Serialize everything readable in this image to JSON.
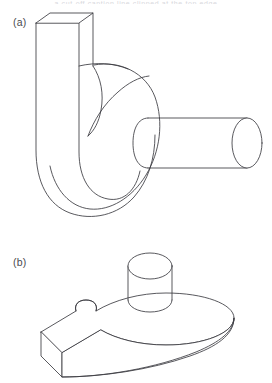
{
  "figure": {
    "background_color": "#ffffff",
    "line_color": "#3b3b41",
    "label_color": "#4a4a50",
    "caption_remnant": "a cut-off caption line clipped at the top edge",
    "panels": [
      {
        "id": "a",
        "label": "(a)",
        "description": "Isometric line drawing of a J-shaped hook bracket standing upright: a tall rectangular prism arm on the left curving into a rounded hook at the bottom, with a horizontal cylindrical boss projecting to the right from a disc-shaped head.",
        "features": [
          "rectangular-prism-arm",
          "curved-hook-base",
          "circular-disc-head",
          "horizontal-cylinder-boss",
          "concave-fillet-notch"
        ]
      },
      {
        "id": "b",
        "label": "(b)",
        "description": "Isometric line drawing of the same part lying flat: a teardrop shaped slab plate with a rectangular tab at the lower-left, a concave notch on its left side, and a short vertical cylindrical boss rising from the top face.",
        "features": [
          "teardrop-slab-plate",
          "rectangular-tab-end",
          "concave-notch",
          "vertical-cylinder-boss",
          "slab-thickness-edge"
        ]
      }
    ]
  }
}
